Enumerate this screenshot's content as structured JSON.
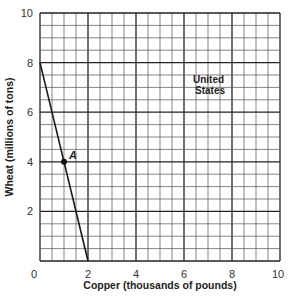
{
  "chart_data": {
    "type": "line",
    "title": "",
    "xlabel": "Copper (thousands of pounds)",
    "ylabel": "Wheat (millions of tons)",
    "xlim": [
      0,
      10
    ],
    "ylim": [
      0,
      10
    ],
    "x_ticks": [
      0,
      2,
      4,
      6,
      8,
      10
    ],
    "y_ticks": [
      2,
      4,
      6,
      8,
      10
    ],
    "x_tick_labels": [
      "0",
      "2",
      "4",
      "6",
      "8",
      "10"
    ],
    "y_tick_labels": [
      "2",
      "4",
      "6",
      "8",
      "10"
    ],
    "grid": true,
    "grid_minor_step": 0.5,
    "grid_major_step": 2,
    "series": [
      {
        "name": "United States",
        "x": [
          0,
          2
        ],
        "y": [
          8,
          0
        ]
      }
    ],
    "points": [
      {
        "label": "A",
        "x": 1,
        "y": 4
      }
    ],
    "annotations": [
      {
        "text_line1": "United",
        "text_line2": "States",
        "x": 6.5,
        "y": 6.8
      }
    ]
  },
  "labels": {
    "xlabel": "Copper (thousands of pounds)",
    "ylabel": "Wheat (millions of tons)",
    "point_a": "A",
    "annotation_line1": "United",
    "annotation_line2": "States",
    "x_tick_0": "0",
    "x_tick_2": "2",
    "x_tick_4": "4",
    "x_tick_6": "6",
    "x_tick_8": "8",
    "x_tick_10": "10",
    "y_tick_2": "2",
    "y_tick_4": "4",
    "y_tick_6": "6",
    "y_tick_8": "8",
    "y_tick_10": "10"
  },
  "colors": {
    "grid_minor": "#555555",
    "grid_major": "#222222",
    "line": "#1a1a1a"
  }
}
